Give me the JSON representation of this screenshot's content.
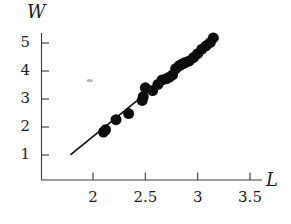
{
  "figure": {
    "corner_glyph": ")",
    "background_color": "#ffffff",
    "point_color": "#0d0d0d",
    "line_color": "#111111",
    "axis_color": "#3a3a3a"
  },
  "chart_data": {
    "type": "scatter",
    "title": "",
    "subtitle": "",
    "xlabel": "L",
    "ylabel": "W",
    "xlim": [
      1.72,
      3.68
    ],
    "ylim": [
      0.45,
      5.6
    ],
    "grid": false,
    "legend": null,
    "x_ticks": [
      2,
      2.5,
      3,
      3.5
    ],
    "x_tick_labels": [
      "2",
      "2.5",
      "3",
      "3.5"
    ],
    "y_ticks": [
      1,
      2,
      3,
      4,
      5
    ],
    "y_tick_labels": [
      "1",
      "2",
      "3",
      "4",
      "5"
    ],
    "series": [
      {
        "name": "data",
        "marker": "filled-circle",
        "marker_size_px": 11,
        "x": [
          2.1,
          2.12,
          2.22,
          2.34,
          2.47,
          2.48,
          2.5,
          2.57,
          2.62,
          2.66,
          2.7,
          2.73,
          2.76,
          2.79,
          2.82,
          2.84,
          2.86,
          2.88,
          2.92,
          2.96,
          3.0,
          3.04,
          3.08,
          3.12,
          3.15
        ],
        "y": [
          1.82,
          1.9,
          2.26,
          2.48,
          2.95,
          3.08,
          3.4,
          3.3,
          3.52,
          3.68,
          3.72,
          3.78,
          3.86,
          4.08,
          4.18,
          4.22,
          4.26,
          4.3,
          4.36,
          4.48,
          4.62,
          4.78,
          4.9,
          5.02,
          5.18
        ]
      }
    ],
    "fit_line": {
      "name": "fitted-line",
      "x_start": 1.79,
      "y_start": 1.02,
      "x_end": 3.17,
      "y_end": 5.22
    },
    "artifact": {
      "name": "stray-mark",
      "x": 1.97,
      "y": 3.66
    }
  }
}
